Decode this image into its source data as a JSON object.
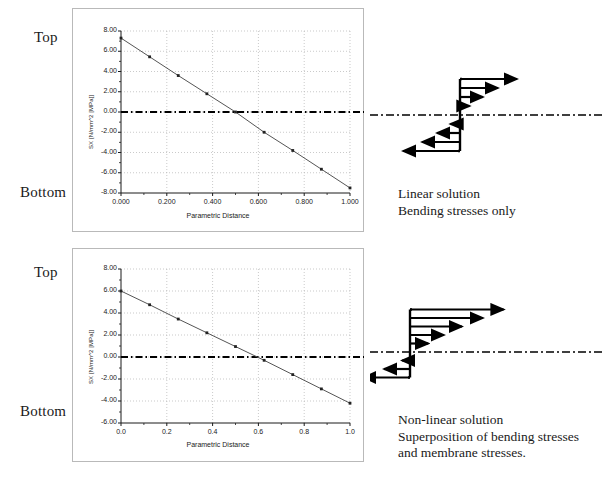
{
  "figure": {
    "labels": {
      "top": "Top",
      "bottom": "Bottom"
    },
    "annotations": {
      "upper": [
        "Linear solution",
        "Bending stresses only"
      ],
      "lower": [
        "Non-linear solution",
        "Superposition of bending stresses",
        "and membrane stresses."
      ]
    },
    "neutral_axis_style": "dash-dot"
  },
  "chart_data": [
    {
      "type": "line",
      "id": "linear-bending-stress",
      "title": "",
      "xlabel": "Parametric Distance",
      "ylabel": "SX [N/mm^2 [MPa]]",
      "xlim": [
        0.0,
        1.0
      ],
      "ylim": [
        -8.0,
        8.0
      ],
      "grid": true,
      "xticks": [
        0.0,
        0.2,
        0.4,
        0.6,
        0.8,
        1.0
      ],
      "xticklabels": [
        "0.000",
        "0.200",
        "0.400",
        "0.600",
        "0.800",
        "1.000"
      ],
      "yticks": [
        -8.0,
        -6.0,
        -4.0,
        -2.0,
        0.0,
        2.0,
        4.0,
        6.0,
        8.0
      ],
      "yticklabels": [
        "-8.00",
        "-6.00",
        "-4.00",
        "-2.00",
        "0.00",
        "2.00",
        "4.00",
        "6.00",
        "8.00"
      ],
      "x": [
        0.0,
        0.125,
        0.25,
        0.375,
        0.5,
        0.625,
        0.75,
        0.875,
        1.0
      ],
      "values": [
        7.3,
        5.45,
        3.6,
        1.8,
        0.0,
        -2.0,
        -3.8,
        -5.65,
        -7.5
      ],
      "markers": true,
      "reference_line": 0.0
    },
    {
      "type": "line",
      "id": "nonlinear-superposed-stress",
      "title": "",
      "xlabel": "Parametric Distance",
      "ylabel": "SX [N/mm^2 [MPa]]",
      "xlim": [
        0.0,
        1.0
      ],
      "ylim": [
        -6.0,
        8.0
      ],
      "grid": true,
      "xticks": [
        0.0,
        0.2,
        0.4,
        0.6,
        0.8,
        1.0
      ],
      "xticklabels": [
        "0.0",
        "0.2",
        "0.4",
        "0.6",
        "0.8",
        "1.0"
      ],
      "yticks": [
        -6.0,
        -4.0,
        -2.0,
        0.0,
        2.0,
        4.0,
        6.0,
        8.0
      ],
      "yticklabels": [
        "-6.00",
        "-4.00",
        "-2.00",
        "0.00",
        "2.00",
        "4.00",
        "6.00",
        "8.00"
      ],
      "x": [
        0.0,
        0.125,
        0.25,
        0.375,
        0.5,
        0.625,
        0.75,
        0.875,
        1.0
      ],
      "values": [
        6.0,
        4.75,
        3.45,
        2.2,
        0.95,
        -0.3,
        -1.6,
        -2.9,
        -4.2
      ],
      "markers": true,
      "reference_line": 0.0
    }
  ],
  "stress_diagrams": [
    {
      "id": "bending-only-arrows",
      "caption": "Linear bending stress block",
      "right_arrows": [
        3.0,
        2.0,
        1.2,
        0.5
      ],
      "left_arrows": [
        -0.5,
        -1.2,
        -2.0,
        -3.0
      ]
    },
    {
      "id": "bending-plus-membrane-arrows",
      "caption": "Superposed bending plus membrane stress block",
      "right_arrows": [
        3.6,
        2.8,
        2.0,
        1.3,
        0.7
      ],
      "left_arrows": [
        -0.3,
        -1.0,
        -1.8
      ]
    }
  ]
}
